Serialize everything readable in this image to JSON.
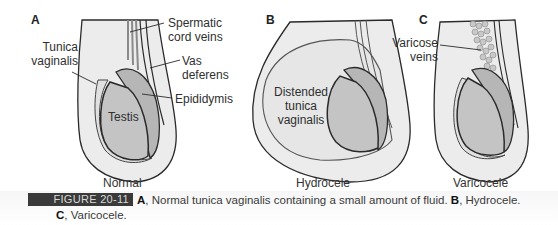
{
  "panels": [
    {
      "letter": "A",
      "title": "Normal",
      "labels": {
        "spermatic_cord_veins_1": "Spermatic",
        "spermatic_cord_veins_2": "cord veins",
        "tunica_vaginalis_1": "Tunica",
        "tunica_vaginalis_2": "vaginalis",
        "vas_deferens_1": "Vas",
        "vas_deferens_2": "deferens",
        "epididymis": "Epididymis",
        "testis": "Testis"
      }
    },
    {
      "letter": "B",
      "title": "Hydrocele",
      "labels": {
        "distended_1": "Distended",
        "distended_2": "tunica",
        "distended_3": "vaginalis"
      }
    },
    {
      "letter": "C",
      "title": "Varicocele",
      "labels": {
        "varicose_1": "Varicose",
        "varicose_2": "veins"
      }
    }
  ],
  "caption": {
    "figure_tag": "FIGURE 20-11",
    "a_letter": "A",
    "a_text": ", Normal tunica vaginalis containing a small amount of fluid. ",
    "b_letter": "B",
    "b_text": ", Hydrocele.",
    "c_letter": "C",
    "c_text": ", Varicocele."
  },
  "colors": {
    "scrotum_fill": "#ececec",
    "tunica_fill": "#e4e4e4",
    "testis_fill": "#c4c4c4",
    "epididymis_fill": "#b6b6b6",
    "outline": "#2a2a2a",
    "figure_tag_bg": "#3a3a3a"
  }
}
